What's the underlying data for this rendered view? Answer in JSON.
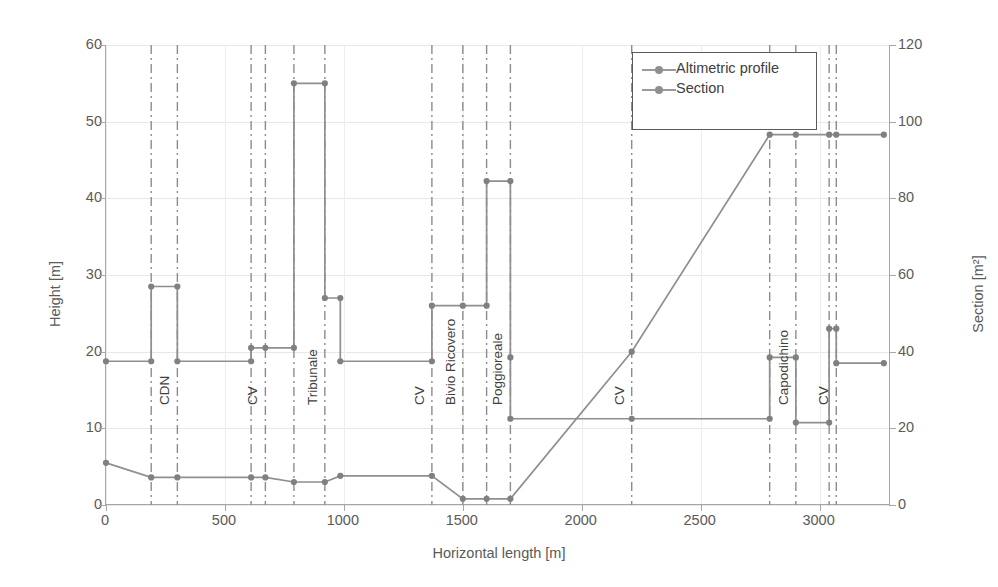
{
  "chart_data": {
    "type": "line",
    "title": "",
    "xlabel": "Horizontal length [m]",
    "ylabel": "Height [m]",
    "y2label": "Section [m²]",
    "xlim": [
      0,
      3300
    ],
    "ylim": [
      0,
      60
    ],
    "y2lim": [
      0,
      120
    ],
    "xticks": [
      0,
      500,
      1000,
      1500,
      2000,
      2500,
      3000
    ],
    "yticks": [
      0,
      10,
      20,
      30,
      40,
      50,
      60
    ],
    "y2ticks": [
      0,
      20,
      40,
      60,
      80,
      100,
      120
    ],
    "grid": true,
    "legend_position": "top-right",
    "series": [
      {
        "name": "Altimetric profile",
        "axis": "left",
        "units": "m",
        "points": [
          [
            0,
            5.5
          ],
          [
            190,
            3.6
          ],
          [
            300,
            3.6
          ],
          [
            610,
            3.6
          ],
          [
            670,
            3.6
          ],
          [
            790,
            3.0
          ],
          [
            920,
            3.0
          ],
          [
            985,
            3.8
          ],
          [
            1370,
            3.8
          ],
          [
            1500,
            0.8
          ],
          [
            1600,
            0.8
          ],
          [
            1700,
            0.8
          ],
          [
            2210,
            20.0
          ],
          [
            2790,
            48.3
          ],
          [
            2900,
            48.3
          ],
          [
            3040,
            48.3
          ],
          [
            3070,
            48.3
          ],
          [
            3270,
            48.3
          ]
        ]
      },
      {
        "name": "Section",
        "axis": "right",
        "units": "m²",
        "step": true,
        "points": [
          [
            0,
            37.5
          ],
          [
            190,
            37.5
          ],
          [
            190,
            57.0
          ],
          [
            300,
            57.0
          ],
          [
            300,
            37.5
          ],
          [
            610,
            37.5
          ],
          [
            610,
            41.0
          ],
          [
            670,
            41.0
          ],
          [
            790,
            41.0
          ],
          [
            790,
            110.0
          ],
          [
            920,
            110.0
          ],
          [
            920,
            54.0
          ],
          [
            985,
            54.0
          ],
          [
            985,
            37.5
          ],
          [
            1370,
            37.5
          ],
          [
            1370,
            52.0
          ],
          [
            1500,
            52.0
          ],
          [
            1600,
            52.0
          ],
          [
            1600,
            84.5
          ],
          [
            1700,
            84.5
          ],
          [
            1700,
            38.5
          ],
          [
            1700,
            22.5
          ],
          [
            2210,
            22.5
          ],
          [
            2790,
            22.5
          ],
          [
            2790,
            38.5
          ],
          [
            2900,
            38.5
          ],
          [
            2900,
            21.5
          ],
          [
            3040,
            21.5
          ],
          [
            3040,
            46.0
          ],
          [
            3070,
            46.0
          ],
          [
            3070,
            37.0
          ],
          [
            3270,
            37.0
          ]
        ]
      }
    ],
    "stations": [
      {
        "label": "CDN",
        "x": 190,
        "label_x": 300
      },
      {
        "label": "CV",
        "x": 610,
        "label_x": 670
      },
      {
        "label": "Tribunale",
        "x": 790,
        "label_x": 920
      },
      {
        "label": "CV",
        "x": 1370,
        "label_x": 1370
      },
      {
        "label": "Bivio Ricovero",
        "x": 1500,
        "label_x": 1500
      },
      {
        "label": "Poggioreale",
        "x": 1600,
        "label_x": 1700
      },
      {
        "label": "CV",
        "x": 2210,
        "label_x": 2210
      },
      {
        "label": "Capodichino",
        "x": 2790,
        "label_x": 2900
      },
      {
        "label": "CV",
        "x": 3040,
        "label_x": 3070
      }
    ],
    "station_line_x": [
      190,
      300,
      610,
      670,
      790,
      920,
      1370,
      1500,
      1600,
      1700,
      2210,
      2790,
      2900,
      3040,
      3070
    ]
  },
  "legend": {
    "entries": [
      {
        "label": "Altimetric profile",
        "marker": "circle-marker",
        "color": "#8f8f8f"
      },
      {
        "label": "Section",
        "marker": "square-marker",
        "color": "#8f8f8f"
      }
    ]
  },
  "colors": {
    "series_line": "#8f8f8f",
    "series_marker": "#808080",
    "axis": "#a6a6a6",
    "grid": "#e8e8e8",
    "station_line": "#8c8c8c",
    "text": "#5a5a5a",
    "background": "#ffffff"
  }
}
